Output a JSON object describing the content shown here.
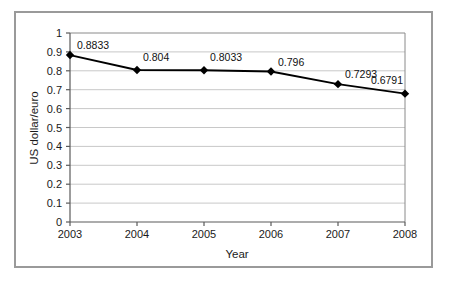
{
  "chart_data": {
    "type": "line",
    "title": "",
    "xlabel": "Year",
    "ylabel": "US dollar/euro",
    "categories": [
      "2003",
      "2004",
      "2005",
      "2006",
      "2007",
      "2008"
    ],
    "values": [
      0.8833,
      0.804,
      0.8033,
      0.796,
      0.7293,
      0.6791
    ],
    "point_labels": [
      "0.8833",
      "0.804",
      "0.8033",
      "0.796",
      "0.7293",
      "0.6791"
    ],
    "series": [
      {
        "name": "US dollar/euro",
        "values": [
          0.8833,
          0.804,
          0.8033,
          0.796,
          0.7293,
          0.6791
        ],
        "color": "#000000",
        "marker": "diamond"
      }
    ],
    "ylim": [
      0,
      1
    ],
    "ytick_step": 0.1,
    "ytick_labels": [
      "0",
      "0.1",
      "0.2",
      "0.3",
      "0.4",
      "0.5",
      "0.6",
      "0.7",
      "0.8",
      "0.9",
      "1"
    ],
    "xtick_labels": [
      "2003",
      "2004",
      "2005",
      "2006",
      "2007",
      "2008"
    ],
    "grid": {
      "horizontal": true,
      "vertical": false,
      "color": "#c8c8c8"
    },
    "legend": {
      "visible": false,
      "position": "none"
    },
    "plot_border": {
      "color": "#808080",
      "visible": true
    },
    "frame_color": "#9a9a9a",
    "background": "#ffffff"
  }
}
